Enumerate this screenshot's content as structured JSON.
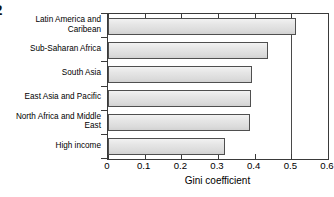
{
  "figure": {
    "number_fragment": "2"
  },
  "chart_data": {
    "type": "bar",
    "orientation": "horizontal",
    "title": "",
    "xlabel": "Gini coefficient",
    "ylabel": "",
    "xlim": [
      0,
      0.6
    ],
    "xticks": [
      "0",
      "0.1",
      "0.2",
      "0.3",
      "0.4",
      "0.5",
      "0.6"
    ],
    "xtick_values": [
      0,
      0.1,
      0.2,
      0.3,
      0.4,
      0.5,
      0.6
    ],
    "grid": false,
    "reference_lines": [
      0.5
    ],
    "legend": "none",
    "categories": [
      "Latin America and\nCaribean",
      "Sub-Saharan Africa",
      "South Asia",
      "East Asia and Pacific",
      "North Africa and Middle\nEast",
      "High income"
    ],
    "values": [
      0.512,
      0.435,
      0.392,
      0.39,
      0.388,
      0.32
    ],
    "bar_fill": "#e2e2e2",
    "bar_edge": "#4f4f4f"
  }
}
